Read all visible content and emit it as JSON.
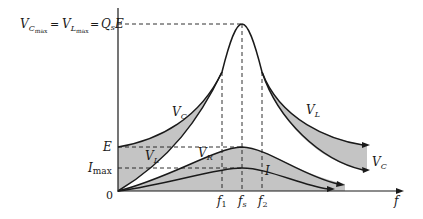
{
  "diagram": {
    "title_formula": {
      "vcmax": "V",
      "vcmax_sub": "C",
      "vcmax_subsub": "max",
      "eq1": "=",
      "vlmax": "V",
      "vlmax_sub": "L",
      "vlmax_subsub": "max",
      "eq2": "=",
      "qs": "Q",
      "qs_sub": "s",
      "e": "E"
    },
    "y_labels": {
      "E": "E",
      "imax": "I",
      "imax_sub": "max",
      "origin": "0"
    },
    "x_labels": {
      "f1": "f",
      "f1_sub": "1",
      "fs": "f",
      "fs_sub": "s",
      "f2": "f",
      "f2_sub": "2",
      "f": "f"
    },
    "curve_labels": {
      "vc_left": "V",
      "vc_left_sub": "C",
      "vl_left": "V",
      "vl_left_sub": "L",
      "vr": "V",
      "vr_sub": "R",
      "i": "I",
      "vl_right": "V",
      "vl_right_sub": "L",
      "vc_right": "V",
      "vc_right_sub": "C"
    },
    "colors": {
      "shade": "#c4c4c4",
      "line": "#1a1a1a"
    }
  }
}
